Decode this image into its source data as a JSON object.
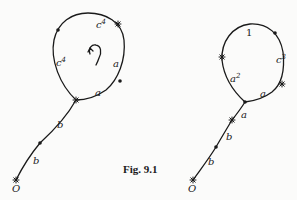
{
  "figure": {
    "caption": "Fig. 9.1",
    "stroke_color": "#1a1a1a",
    "left_diagram": {
      "origin_label": "O",
      "stem_labels": [
        "b",
        "b"
      ],
      "loop_labels": {
        "top": {
          "base": "c",
          "exp": "4"
        },
        "left": {
          "base": "c",
          "exp": "4"
        },
        "right_upper": "a",
        "right_lower": "a"
      },
      "center_icon": "curved-arrow-icon"
    },
    "right_diagram": {
      "origin_label": "O",
      "stem_labels": [
        "b",
        "b",
        "a"
      ],
      "loop_labels": {
        "top": "1",
        "right": {
          "base": "c",
          "exp": "3"
        },
        "left": {
          "base": "a",
          "exp": "2"
        },
        "bottom_right": "a"
      }
    }
  }
}
